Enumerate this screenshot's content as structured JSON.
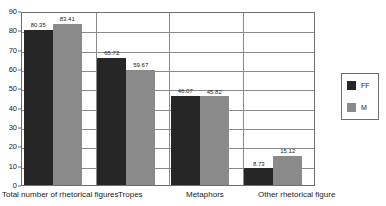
{
  "chart_data": {
    "type": "bar",
    "title": "",
    "subtitle": "",
    "xlabel": "",
    "ylabel": "",
    "ylim": [
      0,
      90
    ],
    "ytick_step": 10,
    "yticks": [
      "90",
      "80",
      "70",
      "60",
      "50",
      "40",
      "30",
      "20",
      "10",
      "0"
    ],
    "grid": "horizontal",
    "legend_position": "right",
    "categories": [
      "Total number of rhetorical figures",
      "Tropes",
      "Metaphors",
      "Other rhetorical figure"
    ],
    "series": [
      {
        "name": "FF",
        "color": "#262626",
        "values": [
          80.35,
          65.72,
          46.07,
          8.73
        ],
        "labels": [
          "80.35",
          "65.72",
          "46.07",
          "8.73"
        ]
      },
      {
        "name": "M",
        "color": "#8a8a8a",
        "values": [
          83.41,
          59.67,
          45.82,
          15.12
        ],
        "labels": [
          "83.41",
          "59.67",
          "45.82",
          "15.12"
        ]
      }
    ]
  },
  "legend": {
    "entries": [
      {
        "label": "FF",
        "color": "#262626"
      },
      {
        "label": "M",
        "color": "#8a8a8a"
      }
    ]
  },
  "colors": {
    "ff": "#262626",
    "m": "#8a8a8a",
    "grid": "#8a8a8a",
    "frame": "#6e6e6e",
    "background": "#ffffff",
    "text": "#1a1a1a"
  }
}
